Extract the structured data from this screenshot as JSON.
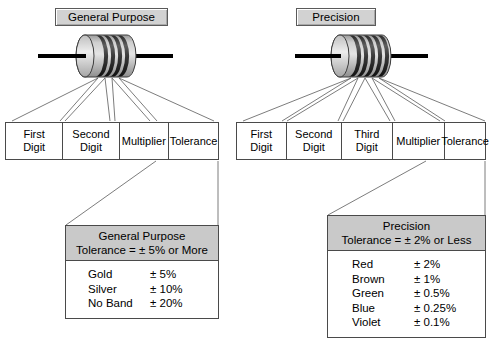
{
  "figure": {
    "background_color": "#ffffff",
    "line_color": "#4a4a4a",
    "chip_fill": "#d2d2d2",
    "header_fill": "#c9c9c9",
    "body_fill": "#b4b4b4"
  },
  "general": {
    "chip_label": "General Purpose",
    "resistor": {
      "name": "general-purpose-resistor",
      "band_count": 4,
      "body_fill": "#b4b4b4",
      "band_fill": "#3c3c3c",
      "lead_color": "#000000"
    },
    "bands": [
      {
        "label": "First\nDigit"
      },
      {
        "label": "Second\nDigit"
      },
      {
        "label": "Multiplier"
      },
      {
        "label": "Tolerance"
      }
    ],
    "tolerance_box": {
      "header_line1": "General Purpose",
      "header_line2": "Tolerance = ± 5% or More",
      "rows": [
        {
          "color": "Gold",
          "tolerance": "± 5%"
        },
        {
          "color": "Silver",
          "tolerance": "± 10%"
        },
        {
          "color": "No Band",
          "tolerance": "± 20%"
        }
      ]
    }
  },
  "precision": {
    "chip_label": "Precision",
    "resistor": {
      "name": "precision-resistor",
      "band_count": 5,
      "body_fill": "#b4b4b4",
      "band_fill": "#3c3c3c",
      "lead_color": "#000000"
    },
    "bands": [
      {
        "label": "First\nDigit"
      },
      {
        "label": "Second\nDigit"
      },
      {
        "label": "Third\nDigit"
      },
      {
        "label": "Multiplier"
      },
      {
        "label": "Tolerance"
      }
    ],
    "tolerance_box": {
      "header_line1": "Precision",
      "header_line2": "Tolerance = ± 2% or Less",
      "rows": [
        {
          "color": "Red",
          "tolerance": "± 2%"
        },
        {
          "color": "Brown",
          "tolerance": "± 1%"
        },
        {
          "color": "Green",
          "tolerance": "± 0.5%"
        },
        {
          "color": "Blue",
          "tolerance": "± 0.25%"
        },
        {
          "color": "Violet",
          "tolerance": "± 0.1%"
        }
      ]
    }
  }
}
